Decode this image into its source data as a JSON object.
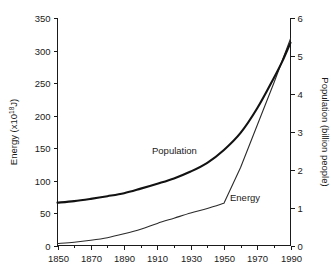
{
  "chart_data": {
    "type": "line",
    "title": "",
    "xlabel": "",
    "ylabel": "Energy (x10",
    "ylabel_exponent": "18",
    "ylabel_suffix": "J)",
    "y2label": "Population (billion people)",
    "xlim": [
      1850,
      1990
    ],
    "ylim": [
      0,
      350
    ],
    "y2lim": [
      0,
      6
    ],
    "grid": false,
    "legend_position": "inline-annotations",
    "x_ticks": [
      1850,
      1870,
      1890,
      1910,
      1930,
      1950,
      1970,
      1990
    ],
    "x_tick_labels": [
      "1850",
      "1870",
      "1890",
      "1910",
      "1930",
      "1950",
      "1970",
      "1990"
    ],
    "x_minor_ticks": [
      1860,
      1880,
      1900,
      1920,
      1940,
      1960,
      1980
    ],
    "y_ticks": [
      0,
      50,
      100,
      150,
      200,
      250,
      300,
      350
    ],
    "y_tick_labels": [
      "0",
      "50",
      "100",
      "150",
      "200",
      "250",
      "300",
      "350"
    ],
    "y2_ticks": [
      0,
      1,
      2,
      3,
      4,
      5,
      6
    ],
    "y2_tick_labels": [
      "0",
      "1",
      "2",
      "3",
      "4",
      "5",
      "6"
    ],
    "series": [
      {
        "name": "Population",
        "axis": "right",
        "units": "billion people",
        "label_text": "Population",
        "x": [
          1850,
          1860,
          1870,
          1880,
          1890,
          1900,
          1910,
          1920,
          1930,
          1940,
          1950,
          1960,
          1970,
          1980,
          1985,
          1990
        ],
        "values": [
          1.13,
          1.17,
          1.23,
          1.3,
          1.38,
          1.5,
          1.63,
          1.77,
          1.95,
          2.18,
          2.52,
          2.97,
          3.62,
          4.42,
          4.85,
          5.35
        ]
      },
      {
        "name": "Energy",
        "axis": "left",
        "units": "x10^18 J",
        "label_text": "Energy",
        "x": [
          1850,
          1860,
          1870,
          1880,
          1890,
          1900,
          1910,
          1920,
          1930,
          1940,
          1950,
          1960,
          1970,
          1980,
          1990
        ],
        "values": [
          3,
          5,
          8,
          12,
          18,
          25,
          34,
          42,
          50,
          57,
          65,
          120,
          185,
          250,
          318
        ]
      }
    ],
    "annotations": [
      {
        "text": "Population",
        "x": 1903,
        "y_right_axis": 2.85
      },
      {
        "text": "Energy",
        "x": 1950,
        "y_left_axis": 95
      }
    ],
    "colors": {
      "population_line": "#121212",
      "energy_line": "#2b2b2b",
      "axis": "#1a1a1a",
      "background": "#ffffff"
    }
  }
}
